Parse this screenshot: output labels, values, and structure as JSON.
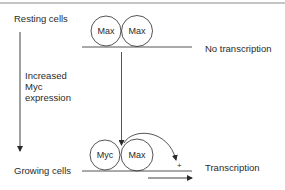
{
  "diagram": {
    "states": {
      "top": {
        "label": "Resting cells",
        "outcome": "No transcription",
        "proteins": [
          "Max",
          "Max"
        ]
      },
      "bottom": {
        "label": "Growing cells",
        "outcome": "Transcription",
        "proteins": [
          "Myc",
          "Max"
        ]
      }
    },
    "transition": {
      "line1": "Increased",
      "line2": "Myc",
      "line3": "expression"
    },
    "activation_mark": "+",
    "colors": {
      "line": "#2a2a2a",
      "border": "#8a8a8a",
      "background": "#ffffff"
    }
  }
}
